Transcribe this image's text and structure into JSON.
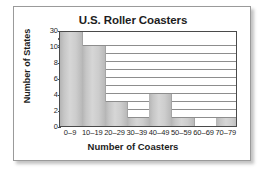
{
  "chart_data": {
    "type": "bar",
    "title": "U.S. Roller Coasters",
    "xlabel": "Number of Coasters",
    "ylabel": "Number of States",
    "categories": [
      "0–9",
      "10–19",
      "20–29",
      "30–39",
      "40–49",
      "50–59",
      "60–69",
      "70–79"
    ],
    "values": [
      30,
      10,
      3,
      1,
      4,
      1,
      0,
      1
    ],
    "ylim": [
      0,
      30
    ],
    "yticks": [
      0,
      2,
      4,
      6,
      8,
      10,
      30
    ],
    "ytick_labels": [
      "0",
      "2",
      "4",
      "6",
      "8",
      "10",
      "30"
    ],
    "axis_break": {
      "present": true,
      "between": [
        10,
        30
      ],
      "symbol": "zigzag"
    },
    "grid": true,
    "grid_interval": 1,
    "legend": "none",
    "bar_color": "#cfcfcf",
    "axis_color": "#4a4a4a",
    "gridline_color": "#8d8d8d",
    "text_color": "#1d1d1d",
    "frame_color": "#9a9a9a"
  }
}
